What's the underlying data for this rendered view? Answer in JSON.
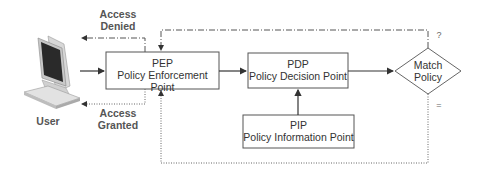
{
  "diagram": {
    "title": "",
    "nodes": {
      "user": {
        "label": "User",
        "icon": "computer-terminal-icon"
      },
      "pep": {
        "abbr": "PEP",
        "name": "Policy Enforcement Point"
      },
      "pdp": {
        "abbr": "PDP",
        "name": "Policy Decision Point"
      },
      "pip": {
        "abbr": "PIP",
        "name": "Policy Information Point"
      },
      "match": {
        "line1": "Match",
        "line2": "Policy"
      }
    },
    "edges": {
      "access_denied": {
        "line1": "Access",
        "line2": "Denied"
      },
      "access_granted": {
        "line1": "Access",
        "line2": "Granted"
      },
      "no_match_symbol": "?",
      "match_symbol": "="
    },
    "colors": {
      "line": "#444444",
      "box_border": "#555555",
      "text": "#333333"
    }
  }
}
